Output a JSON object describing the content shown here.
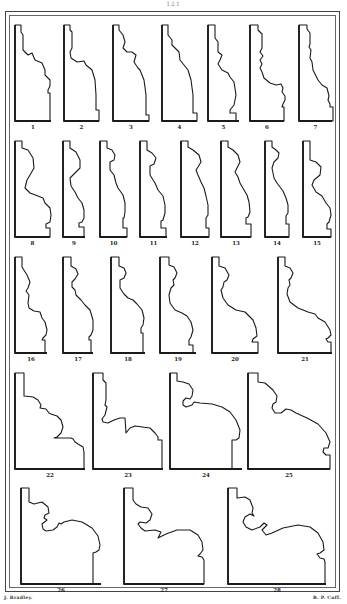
{
  "page": {
    "page_number": "121",
    "credits": {
      "left": "J. Bradley.",
      "right": "R. P. Cuff."
    }
  },
  "figures": [
    {
      "label": "1",
      "x": 15,
      "y": 25,
      "w": 36,
      "h": 96,
      "path": "M15,25 L21,25 L21,32 L23,35 L23,50 L28,55 L32,53 L35,60 L42,63 L45,70 L45,75 L50,80 L50,86 L48,90 L48,93 L50,93 L50,121 L15,121 Z"
    },
    {
      "label": "2",
      "x": 64,
      "y": 25,
      "w": 35,
      "h": 96,
      "path": "M64,25 L70,25 L70,30 L72,32 L72,48 L70,52 L71,58 L77,62 L84,61 L86,65 L92,70 L95,80 L96,95 L96,110 L99,110 L99,121 L64,121 Z"
    },
    {
      "label": "3",
      "x": 113,
      "y": 25,
      "w": 36,
      "h": 96,
      "path": "M113,25 L119,25 L119,30 L123,35 L125,42 L123,48 L127,52 L132,52 L136,55 L134,62 L138,68 L140,70 L144,80 L146,95 L146,115 L149,115 L149,121 L113,121 Z"
    },
    {
      "label": "4",
      "x": 162,
      "y": 25,
      "w": 35,
      "h": 96,
      "path": "M162,25 L168,25 L168,35 L172,40 L172,45 L175,48 L179,52 L180,60 L184,65 L188,70 L191,80 L193,95 L193,113 L197,113 L197,121 L162,121 Z"
    },
    {
      "label": "5",
      "x": 208,
      "y": 25,
      "w": 31,
      "h": 96,
      "path": "M208,25 L215,25 L215,38 L218,42 L218,52 L222,55 L220,60 L218,64 L222,70 L228,73 L230,77 L234,82 L236,95 L234,105 L230,110 L230,113 L236,113 L236,121 L208,121 Z"
    },
    {
      "label": "6",
      "x": 250,
      "y": 25,
      "w": 34,
      "h": 96,
      "path": "M250,25 L258,25 L258,30 L262,34 L262,48 L260,52 L263,56 L260,60 L262,64 L260,68 L262,72 L264,78 L270,83 L276,85 L281,84 L283,88 L282,92 L285,96 L285,100 L283,104 L282,107 L284,107 L284,121 L250,121 Z"
    },
    {
      "label": "7",
      "x": 299,
      "y": 25,
      "w": 33,
      "h": 96,
      "path": "M299,25 L307,25 L307,29 L310,33 L310,44 L309,47 L311,50 L310,58 L312,62 L313,70 L318,80 L322,85 L327,88 L328,92 L329,96 L328,100 L330,104 L330,107 L333,107 L333,121 L299,121 Z"
    },
    {
      "label": "8",
      "x": 15,
      "y": 141,
      "w": 35,
      "h": 96,
      "path": "M15,141 L22,141 L22,148 L28,150 L33,158 L34,168 L30,175 L27,180 L25,188 L30,193 L38,196 L43,198 L45,203 L50,208 L51,215 L50,222 L46,224 L46,228 L50,228 L50,237 L15,237 Z"
    },
    {
      "label": "9",
      "x": 63,
      "y": 141,
      "w": 22,
      "h": 96,
      "path": "M63,141 L70,141 L70,148 L76,152 L80,160 L80,168 L76,172 L70,178 L71,186 L75,192 L78,198 L82,203 L84,210 L84,218 L82,222 L79,223 L79,227 L84,227 L84,237 L63,237 Z"
    },
    {
      "label": "10",
      "x": 100,
      "y": 141,
      "w": 27,
      "h": 96,
      "path": "M100,141 L107,141 L107,148 L112,150 L115,155 L114,160 L110,162 L110,170 L114,175 L116,183 L118,188 L123,195 L125,203 L125,212 L124,218 L123,218 L123,228 L127,228 L127,237 L100,237 Z"
    },
    {
      "label": "11",
      "x": 140,
      "y": 141,
      "w": 27,
      "h": 96,
      "path": "M140,141 L147,141 L147,150 L152,153 L156,158 L154,164 L150,166 L150,175 L155,183 L158,190 L163,196 L165,205 L165,213 L163,220 L161,221 L161,228 L166,228 L166,237 L140,237 Z"
    },
    {
      "label": "12",
      "x": 181,
      "y": 141,
      "w": 28,
      "h": 96,
      "path": "M181,141 L188,141 L188,147 L193,150 L199,155 L201,162 L198,167 L196,170 L198,175 L201,182 L204,188 L206,196 L208,205 L208,215 L206,218 L206,228 L209,228 L209,237 L181,237 Z"
    },
    {
      "label": "13",
      "x": 221,
      "y": 141,
      "w": 30,
      "h": 96,
      "path": "M221,141 L228,141 L228,147 L233,150 L238,155 L240,162 L237,168 L235,172 L238,177 L240,183 L244,190 L247,195 L249,202 L250,212 L248,217 L246,218 L246,224 L251,224 L251,237 L221,237 Z"
    },
    {
      "label": "14",
      "x": 265,
      "y": 141,
      "w": 24,
      "h": 96,
      "path": "M265,141 L272,141 L272,147 L276,150 L279,153 L278,158 L274,162 L272,168 L274,178 L277,183 L283,191 L286,198 L288,205 L288,213 L286,216 L286,224 L289,224 L289,237 L265,237 Z"
    },
    {
      "label": "15",
      "x": 303,
      "y": 141,
      "w": 28,
      "h": 96,
      "path": "M303,141 L310,141 L310,160 L316,162 L321,167 L320,175 L314,180 L312,185 L316,192 L322,196 L326,203 L330,208 L331,215 L329,222 L327,224 L327,229 L331,229 L331,237 L303,237 Z"
    },
    {
      "label": "16",
      "x": 15,
      "y": 257,
      "w": 32,
      "h": 96,
      "path": "M15,257 L22,257 L22,267 L27,275 L30,282 L28,288 L26,291 L29,295 L28,303 L29,308 L34,311 L40,312 L42,318 L45,322 L47,330 L46,335 L43,338 L42,340 L45,340 L45,353 L15,353 Z"
    },
    {
      "label": "17",
      "x": 63,
      "y": 257,
      "w": 30,
      "h": 96,
      "path": "M63,257 L71,257 L71,266 L76,269 L78,274 L75,279 L72,282 L72,287 L75,290 L76,295 L81,300 L85,305 L90,310 L93,320 L93,330 L91,335 L89,337 L89,340 L91,340 L91,353 L63,353 Z"
    },
    {
      "label": "18",
      "x": 111,
      "y": 257,
      "w": 34,
      "h": 96,
      "path": "M111,257 L119,257 L119,266 L124,268 L126,273 L124,278 L120,280 L120,288 L124,294 L128,298 L133,300 L137,304 L142,310 L144,318 L143,325 L141,328 L141,333 L143,333 L143,353 L111,353 Z"
    },
    {
      "label": "19",
      "x": 160,
      "y": 257,
      "w": 36,
      "h": 96,
      "path": "M160,257 L169,257 L169,265 L174,267 L177,273 L175,278 L173,280 L174,285 L171,288 L169,295 L170,303 L175,310 L182,313 L187,316 L191,322 L193,330 L191,337 L189,340 L189,345 L193,345 L193,353 L160,353 Z"
    },
    {
      "label": "20",
      "x": 212,
      "y": 257,
      "w": 46,
      "h": 96,
      "path": "M212,257 L219,257 L219,266 L225,268 L229,275 L227,280 L224,282 L223,287 L221,290 L223,298 L228,305 L236,310 L245,312 L249,316 L253,320 L256,328 L257,336 L253,339 L252,342 L258,342 L258,353 L212,353 Z"
    },
    {
      "label": "21",
      "x": 278,
      "y": 257,
      "w": 54,
      "h": 96,
      "path": "M278,257 L285,257 L285,266 L290,268 L293,273 L291,278 L289,280 L290,285 L288,288 L287,294 L290,302 L298,308 L308,312 L315,314 L318,318 L325,322 L330,330 L331,335 L328,338 L326,339 L328,342 L331,342 L331,353 L278,353 Z"
    },
    {
      "label": "22",
      "x": 15,
      "y": 373,
      "w": 70,
      "h": 96,
      "path": "M15,373 L24,373 L24,396 L33,397 L38,400 L41,405 L40,408 L46,409 L49,413 L51,414 L57,416 L61,420 L63,427 L61,433 L57,437 L54,438 L71,438 L73,439 L75,442 L78,444 L83,447 L84,452 L84,469 L15,469 Z"
    },
    {
      "label": "23",
      "x": 93,
      "y": 373,
      "w": 70,
      "h": 96,
      "path": "M93,373 L103,373 L103,380 L106,383 L106,400 L105,405 L107,407 L105,415 L102,419 L103,422 L108,423 L114,420 L120,418 L125,418 L126,433 L130,428 L135,426 L150,428 L155,433 L158,437 L158,440 L162,440 L162,469 L93,469 Z"
    },
    {
      "label": "24",
      "x": 170,
      "y": 373,
      "w": 72,
      "h": 96,
      "path": "M170,373 L177,373 L177,381 L183,382 L189,384 L193,390 L192,396 L190,399 L186,398 L183,401 L183,405 L186,407 L192,405 L194,402 L200,403 L212,404 L222,407 L230,412 L236,420 L240,430 L239,438 L236,440 L232,440 L232,469 L170,469 Z"
    },
    {
      "label": "25",
      "x": 248,
      "y": 373,
      "w": 82,
      "h": 96,
      "path": "M248,373 L258,373 L258,382 L265,383 L273,390 L277,396 L276,402 L273,404 L272,408 L275,413 L281,413 L286,409 L291,410 L296,413 L307,418 L318,424 L326,433 L330,442 L328,448 L324,448 L323,452 L326,455 L330,455 L330,469 L248,469 Z"
    },
    {
      "label": "26",
      "x": 21,
      "y": 488,
      "w": 80,
      "h": 96,
      "path": "M21,488 L29,488 L29,502 L34,504 L42,502 L48,507 L49,513 L45,515 L44,518 L47,520 L42,524 L43,529 L46,531 L53,530 L57,527 L59,523 L61,524 L64,522 L72,520 L82,522 L92,528 L98,536 L100,545 L99,550 L96,552 L93,553 L93,584 L21,584 Z"
    },
    {
      "label": "27",
      "x": 124,
      "y": 488,
      "w": 80,
      "h": 96,
      "path": "M124,488 L133,488 L133,500 L136,504 L141,507 L148,508 L152,514 L150,520 L146,523 L140,522 L138,524 L141,528 L145,531 L155,530 L161,532 L158,538 L166,534 L177,530 L190,530 L198,535 L202,542 L203,550 L200,554 L198,556 L202,557 L204,560 L204,584 L124,584 Z"
    },
    {
      "label": "28",
      "x": 228,
      "y": 488,
      "w": 98,
      "h": 96,
      "path": "M228,488 L237,488 L237,498 L245,497 L250,500 L253,508 L252,513 L254,516 L250,514 L245,517 L243,522 L246,527 L252,530 L260,527 L264,523 L267,525 L262,530 L266,535 L272,533 L283,528 L298,525 L310,527 L318,533 L323,542 L324,550 L320,553 L317,554 L320,558 L324,559 L325,562 L325,584 L228,584 Z"
    }
  ]
}
